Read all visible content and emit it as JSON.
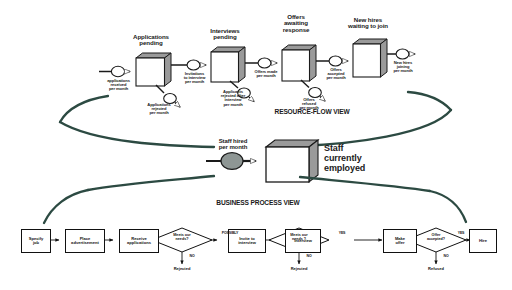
{
  "diagram": {
    "colors": {
      "brace": "#2c4a42",
      "stock_face": "#ffffff",
      "stock_shade": "#9a9a9a",
      "valve_fill": "#ffffff",
      "valve_fill_solid": "#8e9694",
      "line": "#1a1a1a"
    }
  },
  "resource_flow": {
    "title": "RESOURCE-FLOW VIEW",
    "stocks": [
      {
        "id": "applications-pending",
        "label": "Applications\npending",
        "line1": "Applications",
        "line2": "pending"
      },
      {
        "id": "interviews-pending",
        "label": "Interviews\npending",
        "line1": "Interviews",
        "line2": "pending"
      },
      {
        "id": "offers-awaiting-response",
        "label": "Offers awaiting response",
        "line1": "Offers",
        "line2": "awaiting",
        "line3": "response"
      },
      {
        "id": "new-hires-waiting-to-join",
        "label": "New hires waiting to join",
        "line1": "New hires",
        "line2": "waiting to join"
      }
    ],
    "flows": [
      {
        "id": "applications-received",
        "line1": "applications",
        "line2": "received",
        "line3": "per month"
      },
      {
        "id": "applications-rejected",
        "line1": "Applications",
        "line2": "rejected",
        "line3": "per month"
      },
      {
        "id": "invitations-to-interview",
        "line1": "Invitations",
        "line2": "to interview",
        "line3": "per month"
      },
      {
        "id": "applicants-rejected-after-interview",
        "line1": "Applicants",
        "line2": "rejected after",
        "line3": "interview",
        "line4": "per month"
      },
      {
        "id": "offers-made",
        "line1": "Offers made",
        "line2": "per month"
      },
      {
        "id": "offers-refused",
        "line1": "Offers",
        "line2": "refused",
        "line3": "per month"
      },
      {
        "id": "offers-accepted",
        "line1": "Offers",
        "line2": "accepted",
        "line3": "per month"
      },
      {
        "id": "new-hires-joining",
        "line1": "New hires",
        "line2": "joining",
        "line3": "per month"
      }
    ]
  },
  "aggregate": {
    "flow": {
      "id": "staff-hired-per-month",
      "line1": "Staff hired",
      "line2": "per month"
    },
    "stock": {
      "id": "staff-currently-employed",
      "line1": "Staff",
      "line2": "currently",
      "line3": "employed"
    }
  },
  "business_process": {
    "title": "BUSINESS PROCESS VIEW",
    "steps": [
      {
        "id": "specify-job",
        "line1": "Specify",
        "line2": "job"
      },
      {
        "id": "place-advertisement",
        "line1": "Place",
        "line2": "advertisement"
      },
      {
        "id": "receive-applications",
        "line1": "Receive",
        "line2": "applications"
      },
      {
        "id": "invite-to-interview",
        "line1": "Invite to",
        "line2": "interview"
      },
      {
        "id": "interview",
        "line1": "Interview",
        "line2": ""
      },
      {
        "id": "make-offer",
        "line1": "Make",
        "line2": "offer"
      },
      {
        "id": "hire",
        "line1": "Hire",
        "line2": ""
      }
    ],
    "decisions": [
      {
        "id": "meets-our-needs-1",
        "line1": "Meets our",
        "line2": "needs?",
        "yes_label": "POSSIBLY",
        "no_label": "NO",
        "no_outcome": "Rejected"
      },
      {
        "id": "meets-our-needs-2",
        "line1": "Meets our",
        "line2": "needs ?",
        "yes_label": "YES",
        "no_label": "NO",
        "no_outcome": "Rejected"
      },
      {
        "id": "offer-accepted",
        "line1": "Offer",
        "line2": "accepted?",
        "yes_label": "YES",
        "no_label": "NO",
        "no_outcome": "Refused"
      }
    ]
  }
}
